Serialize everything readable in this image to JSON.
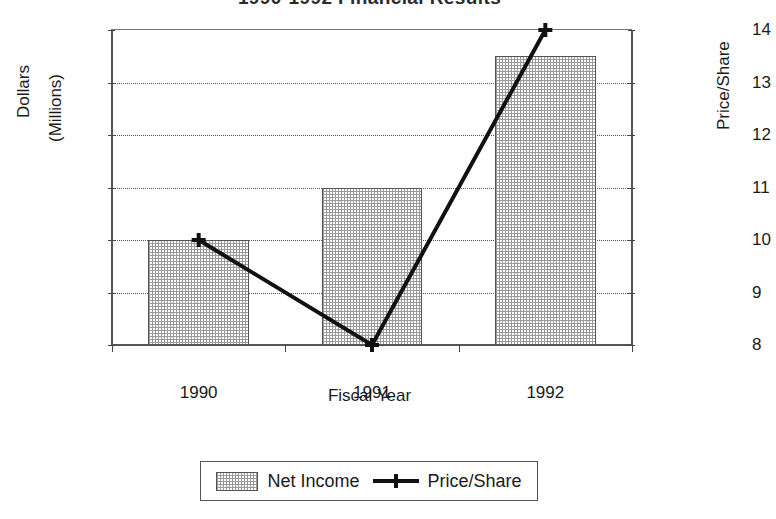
{
  "chart_data": {
    "type": "bar",
    "title": "1990-1992 Financial Results",
    "xlabel": "Fiscal Year",
    "ylabel": "Dollars",
    "ylabel_line2": "(Millions)",
    "ylabel_secondary": "Price/Share",
    "categories": [
      "1990",
      "1991",
      "1992"
    ],
    "grid": true,
    "legend_position": "bottom",
    "ylim": [
      0,
      6
    ],
    "ylim_secondary": [
      8,
      14
    ],
    "yticks": [
      "0",
      "1",
      "2",
      "3",
      "4",
      "5",
      "6"
    ],
    "yticks_secondary": [
      "8",
      "9",
      "10",
      "11",
      "12",
      "13",
      "14"
    ],
    "series": [
      {
        "name": "Net Income",
        "type": "bar",
        "axis": "left",
        "values": [
          2,
          3,
          5.5
        ]
      },
      {
        "name": "Price/Share",
        "type": "line",
        "axis": "right",
        "marker": "plus",
        "values": [
          10,
          8,
          14
        ]
      }
    ]
  },
  "legend": {
    "items": [
      {
        "label": "Net Income",
        "marker": "pattern-swatch"
      },
      {
        "label": "Price/Share",
        "marker": "line-plus"
      }
    ]
  },
  "colors": {
    "bar_fill_dot": "#9a9a9a",
    "bar_border": "#555555",
    "line": "#111111",
    "axis": "#555555",
    "grid": "#555555",
    "background": "#ffffff",
    "text": "#1a1a1a"
  }
}
